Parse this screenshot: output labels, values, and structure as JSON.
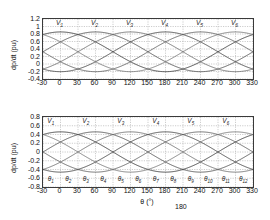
{
  "figure": {
    "note_text": "180"
  },
  "chart_data": [
    {
      "id": "top",
      "type": "line",
      "title": "",
      "xlabel": "",
      "ylabel": "dp/dt (pu)",
      "xlim": [
        -30,
        330
      ],
      "ylim": [
        -0.4,
        1.2
      ],
      "xticks": [
        "-30",
        "0",
        "30",
        "60",
        "90",
        "120",
        "150",
        "180",
        "210",
        "240",
        "270",
        "300",
        "330"
      ],
      "xtick_values": [
        -30,
        0,
        30,
        60,
        90,
        120,
        150,
        180,
        210,
        240,
        270,
        300,
        330
      ],
      "yticks": [
        "1.2",
        "1",
        "0.8",
        "0.6",
        "0.4",
        "0.2",
        "0",
        "-0.2",
        "-0.4"
      ],
      "ytick_values": [
        1.2,
        1,
        0.8,
        0.6,
        0.4,
        0.2,
        0,
        -0.2,
        -0.4
      ],
      "grid": true,
      "legend": "none",
      "annotations": [
        {
          "label": "V",
          "sub": "1",
          "x": 0
        },
        {
          "label": "V",
          "sub": "2",
          "x": 60
        },
        {
          "label": "V",
          "sub": "3",
          "x": 120
        },
        {
          "label": "V",
          "sub": "4",
          "x": 180
        },
        {
          "label": "V",
          "sub": "5",
          "x": 240
        },
        {
          "label": "V",
          "sub": "6",
          "x": 300
        }
      ],
      "series": [
        {
          "name": "V1",
          "color": "#303030",
          "offset": 0.325,
          "amplitude": 0.53,
          "phase": 0
        },
        {
          "name": "V2",
          "color": "#4a4a4a",
          "offset": 0.325,
          "amplitude": 0.53,
          "phase": 60
        },
        {
          "name": "V3",
          "color": "#666666",
          "offset": 0.325,
          "amplitude": 0.53,
          "phase": 120
        },
        {
          "name": "V4",
          "color": "#3c3c3c",
          "offset": 0.325,
          "amplitude": 0.53,
          "phase": 180
        },
        {
          "name": "V5",
          "color": "#575757",
          "offset": 0.325,
          "amplitude": 0.53,
          "phase": 240
        },
        {
          "name": "V6",
          "color": "#707070",
          "offset": 0.325,
          "amplitude": 0.53,
          "phase": 300
        }
      ]
    },
    {
      "id": "bottom",
      "type": "line",
      "title": "",
      "xlabel": "θ (°)",
      "ylabel": "dp/dt (pu)",
      "xlim": [
        -30,
        330
      ],
      "ylim": [
        -0.8,
        0.8
      ],
      "xticks": [
        "-30",
        "0",
        "30",
        "60",
        "90",
        "120",
        "150",
        "180",
        "210",
        "240",
        "270",
        "300",
        "330"
      ],
      "xtick_values": [
        -30,
        0,
        30,
        60,
        90,
        120,
        150,
        180,
        210,
        240,
        270,
        300,
        330
      ],
      "yticks": [
        "0.8",
        "0.6",
        "0.4",
        "0.2",
        "0",
        "-0.2",
        "-0.4",
        "-0.6",
        "-0.8"
      ],
      "ytick_values": [
        0.8,
        0.6,
        0.4,
        0.2,
        0,
        -0.2,
        -0.4,
        -0.6,
        -0.8
      ],
      "grid": true,
      "legend": "none",
      "annotations": [
        {
          "label": "V",
          "sub": "1",
          "x": -15
        },
        {
          "label": "V",
          "sub": "2",
          "x": 45
        },
        {
          "label": "V",
          "sub": "3",
          "x": 105
        },
        {
          "label": "V",
          "sub": "4",
          "x": 165
        },
        {
          "label": "V",
          "sub": "5",
          "x": 225
        },
        {
          "label": "V",
          "sub": "6",
          "x": 285
        }
      ],
      "sector_labels": [
        {
          "label": "θ",
          "sub": "1",
          "x": -15
        },
        {
          "label": "θ",
          "sub": "2",
          "x": 15
        },
        {
          "label": "θ",
          "sub": "3",
          "x": 45
        },
        {
          "label": "θ",
          "sub": "4",
          "x": 75
        },
        {
          "label": "θ",
          "sub": "5",
          "x": 105
        },
        {
          "label": "θ",
          "sub": "6",
          "x": 135
        },
        {
          "label": "θ",
          "sub": "7",
          "x": 165
        },
        {
          "label": "θ",
          "sub": "8",
          "x": 195
        },
        {
          "label": "θ",
          "sub": "9",
          "x": 225
        },
        {
          "label": "θ",
          "sub": "10",
          "x": 255
        },
        {
          "label": "θ",
          "sub": "11",
          "x": 285
        },
        {
          "label": "θ",
          "sub": "12",
          "x": 315
        }
      ],
      "series": [
        {
          "name": "V1",
          "color": "#303030",
          "offset": 0.0,
          "amplitude": 0.46,
          "phase": 0
        },
        {
          "name": "V2",
          "color": "#4a4a4a",
          "offset": 0.0,
          "amplitude": 0.46,
          "phase": 60
        },
        {
          "name": "V3",
          "color": "#666666",
          "offset": 0.0,
          "amplitude": 0.46,
          "phase": 120
        },
        {
          "name": "V4",
          "color": "#3c3c3c",
          "offset": 0.0,
          "amplitude": 0.46,
          "phase": 180
        },
        {
          "name": "V5",
          "color": "#575757",
          "offset": 0.0,
          "amplitude": 0.46,
          "phase": 240
        },
        {
          "name": "V6",
          "color": "#707070",
          "offset": 0.0,
          "amplitude": 0.46,
          "phase": 300
        }
      ]
    }
  ]
}
